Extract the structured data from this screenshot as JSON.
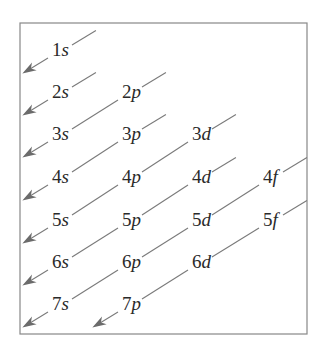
{
  "diagram": {
    "box": {
      "x": 20,
      "y": 23,
      "width": 287,
      "height": 311,
      "stroke": "#888888"
    },
    "colors": {
      "line": "#7a7a7a",
      "arrow": "#6b6b6b",
      "text": "#2a2a2a"
    },
    "orbitals": [
      {
        "n": "1",
        "l": "s",
        "x": 52,
        "y": 56
      },
      {
        "n": "2",
        "l": "s",
        "x": 52,
        "y": 98
      },
      {
        "n": "2",
        "l": "p",
        "x": 122,
        "y": 98
      },
      {
        "n": "3",
        "l": "s",
        "x": 52,
        "y": 140
      },
      {
        "n": "3",
        "l": "p",
        "x": 122,
        "y": 140
      },
      {
        "n": "3",
        "l": "d",
        "x": 192,
        "y": 140
      },
      {
        "n": "4",
        "l": "s",
        "x": 52,
        "y": 183
      },
      {
        "n": "4",
        "l": "p",
        "x": 122,
        "y": 183
      },
      {
        "n": "4",
        "l": "d",
        "x": 192,
        "y": 183
      },
      {
        "n": "4",
        "l": "f",
        "x": 263,
        "y": 183
      },
      {
        "n": "5",
        "l": "s",
        "x": 52,
        "y": 226
      },
      {
        "n": "5",
        "l": "p",
        "x": 122,
        "y": 226
      },
      {
        "n": "5",
        "l": "d",
        "x": 192,
        "y": 226
      },
      {
        "n": "5",
        "l": "f",
        "x": 263,
        "y": 226
      },
      {
        "n": "6",
        "l": "s",
        "x": 52,
        "y": 268
      },
      {
        "n": "6",
        "l": "p",
        "x": 122,
        "y": 268
      },
      {
        "n": "6",
        "l": "d",
        "x": 192,
        "y": 268
      },
      {
        "n": "7",
        "l": "s",
        "x": 52,
        "y": 310
      },
      {
        "n": "7",
        "l": "p",
        "x": 122,
        "y": 310
      }
    ],
    "diagonals": [
      [
        "1s"
      ],
      [
        "2s"
      ],
      [
        "2p",
        "3s"
      ],
      [
        "3p",
        "4s"
      ],
      [
        "3d",
        "4p",
        "5s"
      ],
      [
        "4d",
        "5p",
        "6s"
      ],
      [
        "4f",
        "5d",
        "6p",
        "7s"
      ],
      [
        "5f",
        "6d",
        "7p"
      ]
    ],
    "caption_partial": ""
  }
}
